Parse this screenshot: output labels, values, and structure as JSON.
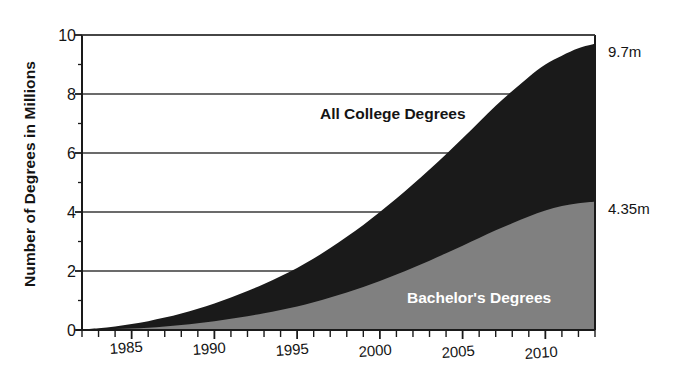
{
  "chart_data": {
    "type": "area",
    "title": "",
    "subtitle": "",
    "xlabel": "",
    "ylabel": "Number of Degrees in Millions",
    "xlim": [
      1982,
      2013
    ],
    "ylim": [
      0,
      10
    ],
    "grid": true,
    "legend_position": "inline-annotation",
    "stacked": true,
    "x_tick_labels": [
      "1985",
      "1990",
      "1995",
      "2000",
      "2005",
      "2010"
    ],
    "x_tick_values": [
      1985,
      1990,
      1995,
      2000,
      2005,
      2010
    ],
    "x_minor_ticks_every": 1,
    "y_tick_labels": [
      "0",
      "2",
      "4",
      "6",
      "8",
      "10"
    ],
    "y_tick_values": [
      0,
      2,
      4,
      6,
      8,
      10
    ],
    "y_minor_ticks_every": 1,
    "x": [
      1982,
      1983,
      1984,
      1985,
      1986,
      1987,
      1988,
      1989,
      1990,
      1991,
      1992,
      1993,
      1994,
      1995,
      1996,
      1997,
      1998,
      1999,
      2000,
      2001,
      2002,
      2003,
      2004,
      2005,
      2006,
      2007,
      2008,
      2009,
      2010,
      2011,
      2012,
      2013
    ],
    "series": [
      {
        "name": "All College Degrees",
        "color": "#1a1a1a",
        "label": "All College  Degrees",
        "endpoint_label": "9.7m",
        "endpoint_value": 9.7,
        "values": [
          0.02,
          0.06,
          0.12,
          0.2,
          0.3,
          0.42,
          0.56,
          0.72,
          0.9,
          1.1,
          1.32,
          1.56,
          1.82,
          2.1,
          2.42,
          2.78,
          3.16,
          3.56,
          4.0,
          4.46,
          4.94,
          5.44,
          5.96,
          6.5,
          7.05,
          7.6,
          8.1,
          8.58,
          9.0,
          9.3,
          9.55,
          9.7
        ]
      },
      {
        "name": "Bachelor's Degrees",
        "color": "#808080",
        "label": "Bachelor's  Degrees",
        "endpoint_label": "4.35m",
        "endpoint_value": 4.35,
        "values": [
          0.0,
          0.01,
          0.03,
          0.05,
          0.08,
          0.12,
          0.17,
          0.23,
          0.3,
          0.38,
          0.47,
          0.57,
          0.68,
          0.8,
          0.94,
          1.1,
          1.27,
          1.46,
          1.66,
          1.88,
          2.11,
          2.35,
          2.6,
          2.86,
          3.12,
          3.38,
          3.62,
          3.85,
          4.05,
          4.2,
          4.3,
          4.35
        ]
      }
    ],
    "annotations": [
      {
        "text": "All College  Degrees",
        "x": 2001,
        "y": 6.7,
        "color": "#141414"
      },
      {
        "text": "Bachelor's  Degrees",
        "x": 2006,
        "y": 1.2,
        "color": "#ffffff"
      },
      {
        "text": "9.7m",
        "x": 2013,
        "y": 9.7,
        "color": "#141414"
      },
      {
        "text": "4.35m",
        "x": 2013,
        "y": 4.35,
        "color": "#141414"
      }
    ],
    "colors": {
      "all_college_degrees": "#1a1a1a",
      "bachelors_degrees": "#808080",
      "axis": "#1a1a1a",
      "grid": "#3a3a3a",
      "background": "#ffffff"
    }
  }
}
